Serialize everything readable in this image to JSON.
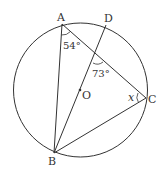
{
  "diagram": {
    "type": "geometry-circle-inscribed-angles",
    "stroke_color": "#333333",
    "circle": {
      "center_label": "O",
      "cx": 80.5,
      "cy": 90,
      "r": 67
    },
    "points": {
      "A": {
        "label": "A",
        "x": 62,
        "y": 24
      },
      "D": {
        "label": "D",
        "x": 106,
        "y": 25
      },
      "C": {
        "label": "C",
        "x": 146,
        "y": 98
      },
      "B": {
        "label": "B",
        "x": 54,
        "y": 153
      },
      "O": {
        "label": "O",
        "x": 80,
        "y": 90
      }
    },
    "segments": [
      "AB",
      "AC",
      "BC",
      "BD"
    ],
    "angles": {
      "BAC": {
        "label": "54°"
      },
      "intersection": {
        "label": "73°"
      },
      "ACB": {
        "label": "x"
      }
    }
  }
}
